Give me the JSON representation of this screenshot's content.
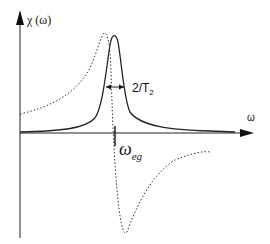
{
  "diagram": {
    "y_axis_label": "χ (ω)",
    "x_axis_label": "ω",
    "width_label": "2/T",
    "width_label_sub": "2",
    "center_label": "ω",
    "center_label_sub": "eg",
    "curves": [
      {
        "name": "absorption",
        "style": "solid",
        "shape": "Lorentzian peak centered at ω_eg"
      },
      {
        "name": "dispersion",
        "style": "dotted",
        "shape": "dispersive curve: positive peak below ω_eg, negative dip above ω_eg"
      }
    ]
  }
}
